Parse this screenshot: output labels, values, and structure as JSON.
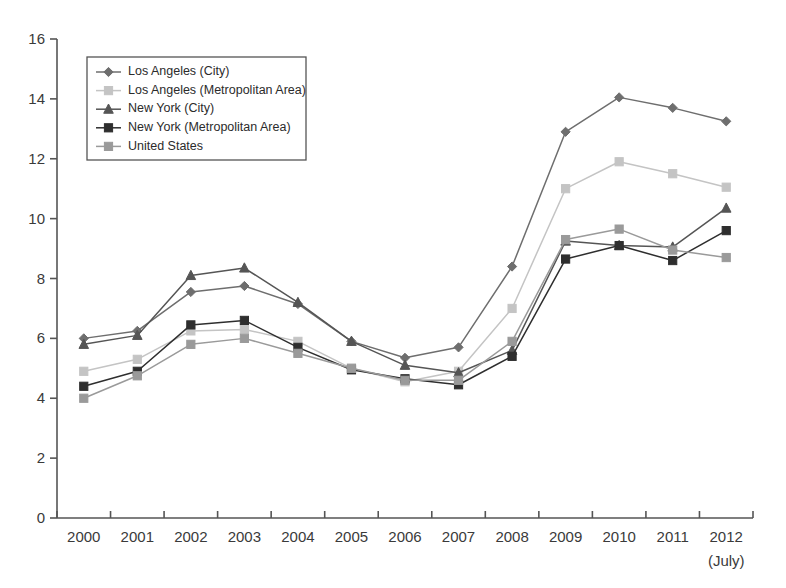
{
  "chart_data": {
    "type": "line",
    "title": "",
    "subtitle": "",
    "xlabel": "",
    "ylabel": "",
    "categories": [
      "2000",
      "2001",
      "2002",
      "2003",
      "2004",
      "2005",
      "2006",
      "2007",
      "2008",
      "2009",
      "2010",
      "2011",
      "2012"
    ],
    "x_tick_labels": [
      "2000",
      "2001",
      "2002",
      "2003",
      "2004",
      "2005",
      "2006",
      "2007",
      "2008",
      "2009",
      "2010",
      "2011",
      "2012"
    ],
    "x_tick_sublabels": [
      "",
      "",
      "",
      "",
      "",
      "",
      "",
      "",
      "",
      "",
      "",
      "",
      "(July)"
    ],
    "y_ticks": [
      0,
      2,
      4,
      6,
      8,
      10,
      12,
      14,
      16
    ],
    "ylim": [
      0,
      16
    ],
    "grid": false,
    "legend_position": "top-left",
    "series": [
      {
        "name": "Los Angeles (City)",
        "marker": "diamond",
        "color": "#6e6e6e",
        "values": [
          6.0,
          6.25,
          7.55,
          7.75,
          7.15,
          5.9,
          5.35,
          5.7,
          8.4,
          12.9,
          14.05,
          13.7,
          13.25
        ]
      },
      {
        "name": "Los Angeles (Metropolitan Area)",
        "marker": "square",
        "color": "#c4c4c4",
        "values": [
          4.9,
          5.3,
          6.25,
          6.3,
          5.9,
          5.0,
          4.55,
          4.9,
          7.0,
          11.0,
          11.9,
          11.5,
          11.05
        ]
      },
      {
        "name": "New York (City)",
        "marker": "triangle",
        "color": "#555555",
        "values": [
          5.8,
          6.1,
          8.1,
          8.35,
          7.2,
          5.9,
          5.1,
          4.85,
          5.6,
          9.25,
          9.1,
          9.05,
          10.35
        ]
      },
      {
        "name": "New York (Metropolitan Area)",
        "marker": "square",
        "color": "#2e2e2e",
        "values": [
          4.4,
          4.9,
          6.45,
          6.6,
          5.7,
          4.95,
          4.65,
          4.45,
          5.4,
          8.65,
          9.1,
          8.6,
          9.6
        ]
      },
      {
        "name": "United States",
        "marker": "square",
        "color": "#9a9a9a",
        "values": [
          4.0,
          4.75,
          5.8,
          6.0,
          5.5,
          5.0,
          4.6,
          4.6,
          5.9,
          9.3,
          9.65,
          8.95,
          8.7
        ]
      }
    ]
  },
  "legend": {
    "items": [
      {
        "label": "Los Angeles (City)"
      },
      {
        "label": "Los Angeles (Metropolitan Area)"
      },
      {
        "label": "New York (City)"
      },
      {
        "label": "New York (Metropolitan Area)"
      },
      {
        "label": "United States"
      }
    ]
  },
  "axis": {
    "y_axis_color": "#555555",
    "x_axis_color": "#555555"
  }
}
